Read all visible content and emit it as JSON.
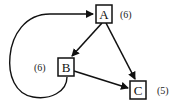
{
  "diagram": {
    "type": "directed-graph",
    "colors": {
      "stroke": "#111111",
      "background": "#ffffff"
    },
    "nodes": [
      {
        "id": "A",
        "label": "A",
        "weight": "(6)"
      },
      {
        "id": "B",
        "label": "B",
        "weight": "(6)"
      },
      {
        "id": "C",
        "label": "C",
        "weight": "(5)"
      }
    ],
    "edges": [
      {
        "from": "A",
        "to": "B"
      },
      {
        "from": "A",
        "to": "C"
      },
      {
        "from": "B",
        "to": "C"
      },
      {
        "from": "B",
        "to": "A",
        "style": "curved"
      }
    ]
  }
}
